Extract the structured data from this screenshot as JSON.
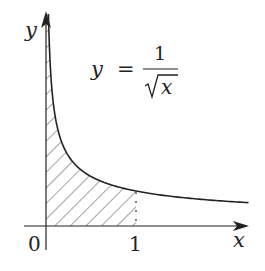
{
  "diagram": {
    "function_label": {
      "lhs": "y",
      "equals": "=",
      "numerator": "1",
      "denominator_var": "x",
      "radical": "√"
    },
    "axes": {
      "x_label": "x",
      "y_label": "y",
      "origin_label": "0",
      "x_tick_label": "1"
    },
    "shaded_region": "area under y = 1/√x from x = 0 to x = 1",
    "colors": {
      "stroke": "#222222",
      "hatch": "#333333",
      "background": "#ffffff"
    }
  },
  "chart_data": {
    "type": "line",
    "xlabel": "x",
    "ylabel": "y",
    "x_ticks": [
      "0",
      "1"
    ],
    "series": [
      {
        "name": "y = 1/√x",
        "x": [
          0.01,
          0.05,
          0.1,
          0.25,
          0.5,
          1,
          1.5,
          2,
          2.23
        ],
        "values": [
          10,
          4.47,
          3.16,
          2,
          1.41,
          1,
          0.82,
          0.71,
          0.67
        ]
      }
    ],
    "shaded": {
      "from": 0,
      "to": 1,
      "pattern": "diagonal hatch"
    },
    "grid": false
  }
}
